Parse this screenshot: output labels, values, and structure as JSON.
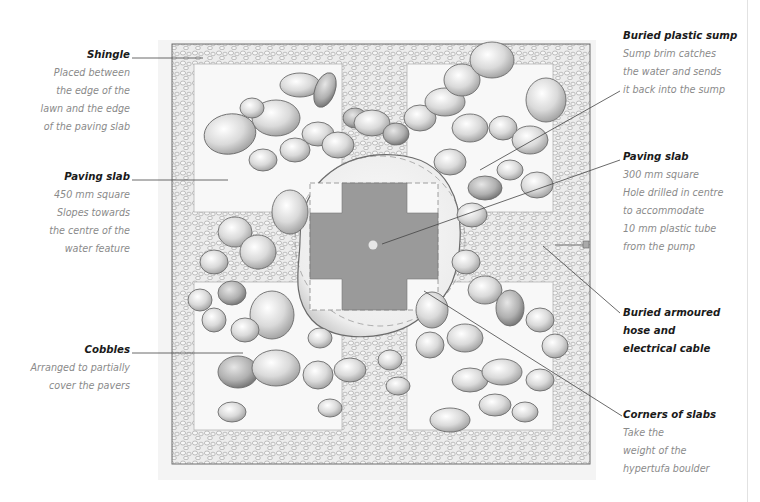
{
  "diagram": {
    "colors": {
      "slab_centre": "#8f8f8f",
      "pebble": "#d4d4d4",
      "leader": "#444444",
      "caption_text": "#8a8a8a",
      "title_text": "#1a1a1a"
    }
  },
  "labels": {
    "shingle": {
      "title": "Shingle",
      "lines": [
        "Placed between",
        "the edge of the",
        "lawn and the edge",
        "of the paving slab"
      ]
    },
    "paving_slab_450": {
      "title": "Paving slab",
      "lines": [
        "450 mm square",
        "Slopes towards",
        "the centre of the",
        "water feature"
      ]
    },
    "cobbles": {
      "title": "Cobbles",
      "lines": [
        "Arranged to partially",
        "cover the pavers"
      ]
    },
    "buried_sump": {
      "title": "Buried plastic sump",
      "lines": [
        "Sump brim catches",
        "the water and sends",
        "it back into the sump"
      ]
    },
    "paving_slab_300": {
      "title": "Paving slab",
      "lines": [
        "300 mm square",
        "Hole drilled in centre",
        "to accommodate",
        "10 mm plastic tube",
        "from the pump"
      ]
    },
    "armoured_hose": {
      "title": "Buried armoured hose and electrical cable",
      "lines": [
        "Buried armoured",
        "hose and",
        "electrical cable"
      ]
    },
    "corners_of_slabs": {
      "title": "Corners of slabs",
      "lines": [
        "Take the",
        "weight of the",
        "hypertufa boulder"
      ]
    }
  }
}
